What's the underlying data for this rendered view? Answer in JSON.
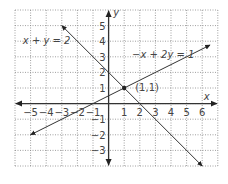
{
  "chart_data": {
    "type": "line",
    "title": "",
    "xlabel": "x",
    "ylabel": "y",
    "xlim": [
      -6,
      7
    ],
    "ylim": [
      -4,
      6
    ],
    "grid": true,
    "x_ticks": [
      -5,
      -4,
      -3,
      -2,
      -1,
      1,
      2,
      3,
      4,
      5,
      6
    ],
    "y_ticks": [
      -3,
      -2,
      -1,
      1,
      2,
      3,
      4,
      5
    ],
    "series": [
      {
        "name": "x + y = 2",
        "equation": "x + y = 2",
        "x": [
          -3,
          6
        ],
        "y": [
          5,
          -4
        ]
      },
      {
        "name": "-x + 2y = 1",
        "equation": "-x + 2y = 1",
        "x": [
          -5,
          6.5
        ],
        "y": [
          -2,
          3.75
        ]
      }
    ],
    "annotations": [
      {
        "text": "(1,1)",
        "x": 1,
        "y": 1,
        "type": "intersection-point"
      }
    ],
    "labels": {
      "line1": "x + y = 2",
      "line2": "−x + 2y = 1",
      "point": "(1,1)",
      "x_axis": "x",
      "y_axis": "y"
    },
    "colors": {
      "line": "#333333",
      "grid": "#888888",
      "text": "#444444"
    }
  }
}
